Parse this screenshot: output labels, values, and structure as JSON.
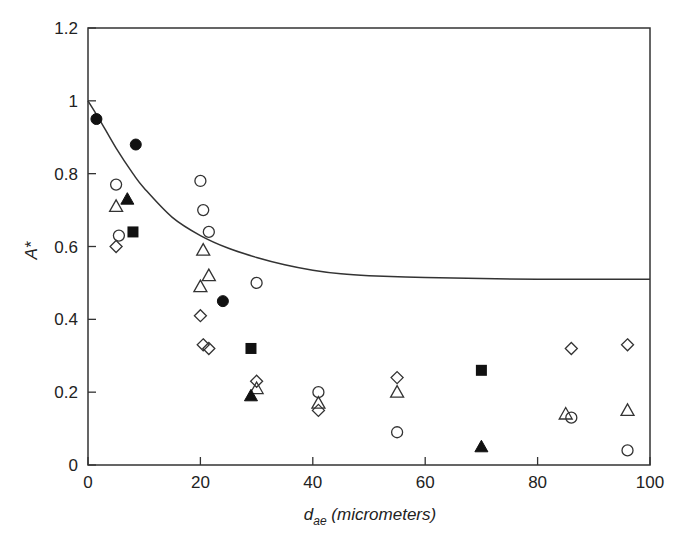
{
  "chart_data": {
    "type": "scatter",
    "title": "",
    "xlabel": "d_ae (micrometers)",
    "xlabel_main": "d",
    "xlabel_sub": "ae",
    "xlabel_rest": " (micrometers)",
    "ylabel": "A*",
    "xlim": [
      0,
      100
    ],
    "ylim": [
      0,
      1.2
    ],
    "x_ticks": [
      0,
      20,
      40,
      60,
      80,
      100
    ],
    "y_ticks": [
      0,
      0.2,
      0.4,
      0.6,
      0.8,
      1,
      1.2
    ],
    "x_tick_labels": [
      "0",
      "20",
      "40",
      "60",
      "80",
      "100"
    ],
    "y_tick_labels": [
      "0",
      "0.2",
      "0.4",
      "0.6",
      "0.8",
      "1",
      "1.2"
    ],
    "grid": false,
    "legend": "none",
    "series": [
      {
        "name": "filled circles",
        "marker": "circle-filled",
        "points": [
          [
            1.5,
            0.95
          ],
          [
            8.5,
            0.88
          ],
          [
            24,
            0.45
          ]
        ]
      },
      {
        "name": "open circles",
        "marker": "circle-open",
        "points": [
          [
            5,
            0.77
          ],
          [
            5.5,
            0.63
          ],
          [
            20,
            0.78
          ],
          [
            20.5,
            0.7
          ],
          [
            21.5,
            0.64
          ],
          [
            30,
            0.5
          ],
          [
            41,
            0.2
          ],
          [
            55,
            0.09
          ],
          [
            86,
            0.13
          ],
          [
            96,
            0.04
          ]
        ]
      },
      {
        "name": "open triangles",
        "marker": "triangle-open",
        "points": [
          [
            5,
            0.71
          ],
          [
            20.5,
            0.59
          ],
          [
            21.5,
            0.52
          ],
          [
            20,
            0.49
          ],
          [
            30,
            0.21
          ],
          [
            41,
            0.17
          ],
          [
            55,
            0.2
          ],
          [
            85,
            0.14
          ],
          [
            96,
            0.15
          ]
        ]
      },
      {
        "name": "filled triangles",
        "marker": "triangle-filled",
        "points": [
          [
            7,
            0.73
          ],
          [
            29,
            0.19
          ],
          [
            70,
            0.05
          ]
        ]
      },
      {
        "name": "filled squares",
        "marker": "square-filled",
        "points": [
          [
            8,
            0.64
          ],
          [
            29,
            0.32
          ],
          [
            70,
            0.26
          ]
        ]
      },
      {
        "name": "open diamonds",
        "marker": "diamond-open",
        "points": [
          [
            5,
            0.6
          ],
          [
            20,
            0.41
          ],
          [
            20.5,
            0.33
          ],
          [
            21.5,
            0.32
          ],
          [
            30,
            0.23
          ],
          [
            41,
            0.15
          ],
          [
            55,
            0.24
          ],
          [
            86,
            0.32
          ],
          [
            96,
            0.33
          ]
        ]
      }
    ],
    "curve": {
      "name": "model curve",
      "points": [
        [
          0,
          1.0
        ],
        [
          2,
          0.95
        ],
        [
          5,
          0.87
        ],
        [
          8,
          0.8
        ],
        [
          10,
          0.76
        ],
        [
          15,
          0.68
        ],
        [
          20,
          0.63
        ],
        [
          25,
          0.595
        ],
        [
          30,
          0.57
        ],
        [
          35,
          0.55
        ],
        [
          40,
          0.535
        ],
        [
          45,
          0.525
        ],
        [
          50,
          0.52
        ],
        [
          60,
          0.515
        ],
        [
          70,
          0.512
        ],
        [
          80,
          0.51
        ],
        [
          90,
          0.51
        ],
        [
          100,
          0.51
        ]
      ]
    }
  }
}
